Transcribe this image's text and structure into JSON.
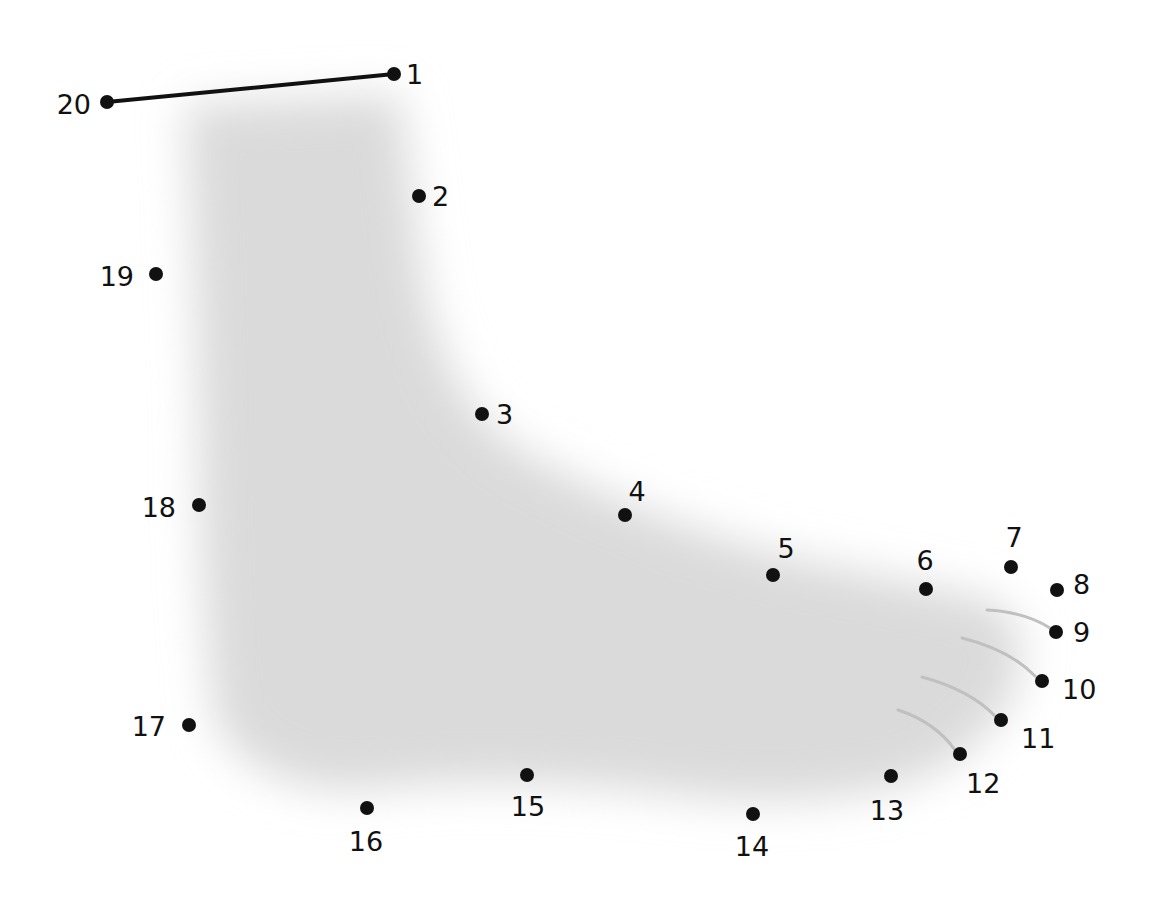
{
  "puzzle": {
    "type": "connect-the-dots",
    "subject_hint": "sock",
    "colors": {
      "dot": "#111111",
      "line": "#111111",
      "shading": "#d9d9d9",
      "stripe": "#bdbdbd",
      "background": "#ffffff"
    },
    "connected_segments": [
      [
        20,
        1
      ]
    ],
    "dots": [
      {
        "n": "1",
        "x": 394,
        "y": 74,
        "lx": 406,
        "ly": 84,
        "anchor": "start"
      },
      {
        "n": "2",
        "x": 419,
        "y": 196,
        "lx": 432,
        "ly": 206,
        "anchor": "start"
      },
      {
        "n": "3",
        "x": 482,
        "y": 414,
        "lx": 496,
        "ly": 424,
        "anchor": "start"
      },
      {
        "n": "4",
        "x": 625,
        "y": 515,
        "lx": 637,
        "ly": 501,
        "anchor": "middle"
      },
      {
        "n": "5",
        "x": 773,
        "y": 575,
        "lx": 786,
        "ly": 558,
        "anchor": "middle"
      },
      {
        "n": "6",
        "x": 926,
        "y": 589,
        "lx": 925,
        "ly": 570,
        "anchor": "middle"
      },
      {
        "n": "7",
        "x": 1011,
        "y": 567,
        "lx": 1014,
        "ly": 547,
        "anchor": "middle"
      },
      {
        "n": "8",
        "x": 1057,
        "y": 590,
        "lx": 1073,
        "ly": 594,
        "anchor": "start"
      },
      {
        "n": "9",
        "x": 1056,
        "y": 632,
        "lx": 1073,
        "ly": 642,
        "anchor": "start"
      },
      {
        "n": "10",
        "x": 1042,
        "y": 681,
        "lx": 1062,
        "ly": 699,
        "anchor": "start"
      },
      {
        "n": "11",
        "x": 1001,
        "y": 720,
        "lx": 1021,
        "ly": 748,
        "anchor": "start"
      },
      {
        "n": "12",
        "x": 960,
        "y": 754,
        "lx": 966,
        "ly": 793,
        "anchor": "start"
      },
      {
        "n": "13",
        "x": 891,
        "y": 776,
        "lx": 887,
        "ly": 820,
        "anchor": "middle"
      },
      {
        "n": "14",
        "x": 753,
        "y": 814,
        "lx": 752,
        "ly": 856,
        "anchor": "middle"
      },
      {
        "n": "15",
        "x": 527,
        "y": 775,
        "lx": 528,
        "ly": 816,
        "anchor": "middle"
      },
      {
        "n": "16",
        "x": 367,
        "y": 808,
        "lx": 366,
        "ly": 851,
        "anchor": "middle"
      },
      {
        "n": "17",
        "x": 189,
        "y": 725,
        "lx": 166,
        "ly": 736,
        "anchor": "end"
      },
      {
        "n": "18",
        "x": 199,
        "y": 505,
        "lx": 176,
        "ly": 517,
        "anchor": "end"
      },
      {
        "n": "19",
        "x": 156,
        "y": 274,
        "lx": 134,
        "ly": 286,
        "anchor": "end"
      },
      {
        "n": "20",
        "x": 107,
        "y": 102,
        "lx": 91,
        "ly": 114,
        "anchor": "end"
      }
    ]
  }
}
